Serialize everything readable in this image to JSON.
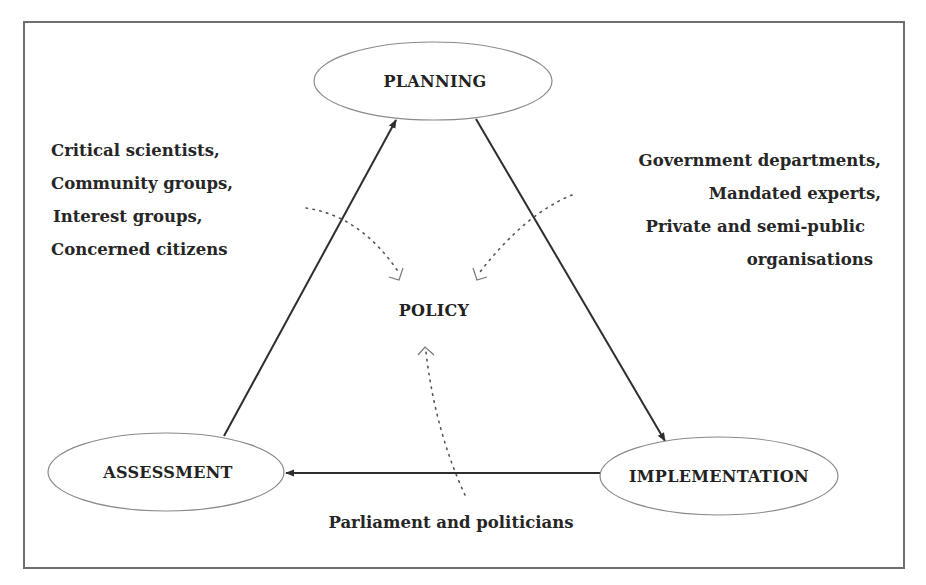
{
  "diagram": {
    "nodes": {
      "planning": "PLANNING",
      "implementation": "IMPLEMENTATION",
      "assessment": "ASSESSMENT",
      "policy": "POLICY"
    },
    "stakeholders": {
      "left": [
        "Critical scientists,",
        "Community groups,",
        "Interest groups,",
        "Concerned citizens"
      ],
      "right": [
        "Government departments,",
        "Mandated experts,",
        "Private and semi-public",
        "organisations"
      ],
      "bottom": "Parliament and politicians"
    },
    "cycle": [
      {
        "from": "PLANNING",
        "to": "IMPLEMENTATION"
      },
      {
        "from": "IMPLEMENTATION",
        "to": "ASSESSMENT"
      },
      {
        "from": "ASSESSMENT",
        "to": "PLANNING"
      }
    ],
    "influences": [
      {
        "from": "left stakeholders",
        "to": "POLICY",
        "style": "dotted"
      },
      {
        "from": "right stakeholders",
        "to": "POLICY",
        "style": "dotted"
      },
      {
        "from": "Parliament and politicians",
        "to": "POLICY",
        "style": "dotted"
      }
    ],
    "colors": {
      "background": "#ffffff",
      "text": "#222222",
      "frame": "#6e6e6e",
      "arrow": "#2e2e2e"
    }
  }
}
